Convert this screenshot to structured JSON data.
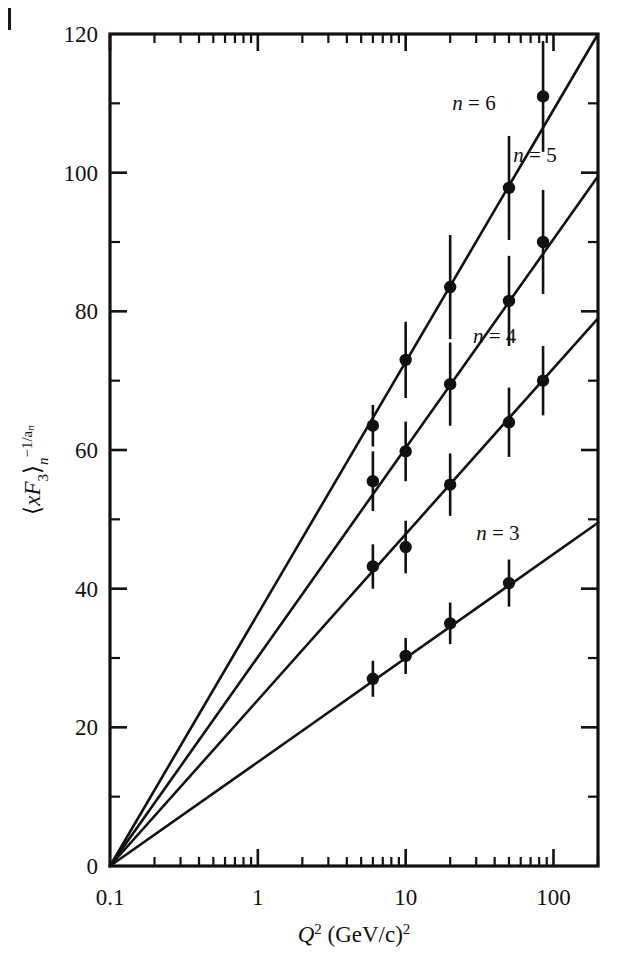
{
  "figure": {
    "background": "#ffffff",
    "ink_color": "#111111",
    "edge_mark": "page-edge-rule"
  },
  "chart_data": {
    "type": "scatter",
    "title": "",
    "subtitle": "",
    "xlabel": "Q² (GeV/c)²",
    "xlabel_parts": {
      "base": "Q",
      "exp": "2",
      "unit": "(GeV/c)",
      "unit_exp": "2"
    },
    "ylabel": "⟨xF₃⟩ₙ^(-1/aₙ)",
    "ylabel_parts": {
      "open": "⟨",
      "x": "x",
      "F": "F",
      "Fsub": "3",
      "close": "⟩",
      "nsub": "n",
      "sup": "−1/a",
      "supsub": "n"
    },
    "xscale": "log",
    "yscale": "linear",
    "xlim": [
      0.1,
      200
    ],
    "ylim": [
      0,
      120
    ],
    "grid": false,
    "legend_position": "inline-annotations",
    "xticks": [
      0.1,
      1,
      10,
      100
    ],
    "xticklabels": [
      "0.1",
      "1",
      "10",
      "100"
    ],
    "yticks": [
      0,
      20,
      40,
      60,
      80,
      100,
      120
    ],
    "yticklabels": [
      "0",
      "20",
      "40",
      "60",
      "80",
      "100",
      "120"
    ],
    "yminorticks": [
      10,
      30,
      50,
      70,
      90,
      110
    ],
    "series": [
      {
        "name": "n = 3",
        "label": "n = 3",
        "label_x": 42,
        "label_y": 47,
        "line": {
          "x0": 0.1,
          "y0": 0,
          "x1": 200,
          "y1": 49.5
        },
        "points": [
          {
            "x": 6.0,
            "y": 27.0,
            "err": 2.6
          },
          {
            "x": 10.0,
            "y": 30.3,
            "err": 2.6
          },
          {
            "x": 20.0,
            "y": 35.0,
            "err": 3.0
          },
          {
            "x": 50.0,
            "y": 40.8,
            "err": 3.4
          }
        ]
      },
      {
        "name": "n = 4",
        "label": "n = 4",
        "label_x": 40,
        "label_y": 75.5,
        "line": {
          "x0": 0.1,
          "y0": 0,
          "x1": 200,
          "y1": 79.0
        },
        "points": [
          {
            "x": 6.0,
            "y": 43.2,
            "err": 3.2
          },
          {
            "x": 10.0,
            "y": 46.0,
            "err": 3.8
          },
          {
            "x": 20.0,
            "y": 55.0,
            "err": 4.5
          },
          {
            "x": 50.0,
            "y": 64.0,
            "err": 5.0
          },
          {
            "x": 85.0,
            "y": 70.0,
            "err": 5.0
          }
        ]
      },
      {
        "name": "n = 5",
        "label": "n = 5",
        "label_x": 75,
        "label_y": 101.5,
        "line": {
          "x0": 0.1,
          "y0": 0,
          "x1": 200,
          "y1": 99.5
        },
        "points": [
          {
            "x": 6.0,
            "y": 55.5,
            "err": 4.3
          },
          {
            "x": 10.0,
            "y": 59.8,
            "err": 4.3
          },
          {
            "x": 20.0,
            "y": 69.5,
            "err": 6.0
          },
          {
            "x": 50.0,
            "y": 81.5,
            "err": 6.5
          },
          {
            "x": 85.0,
            "y": 90.0,
            "err": 7.5
          }
        ]
      },
      {
        "name": "n = 6",
        "label": "n = 6",
        "label_x": 29,
        "label_y": 109.0,
        "line": {
          "x0": 0.1,
          "y0": 0,
          "x1": 200,
          "y1": 120.0
        },
        "points": [
          {
            "x": 6.0,
            "y": 63.5,
            "err": 3.0
          },
          {
            "x": 10.0,
            "y": 73.0,
            "err": 5.5
          },
          {
            "x": 20.0,
            "y": 83.5,
            "err": 7.5
          },
          {
            "x": 50.0,
            "y": 97.8,
            "err": 7.5
          },
          {
            "x": 85.0,
            "y": 111.0,
            "err": 8.0
          }
        ]
      }
    ]
  }
}
